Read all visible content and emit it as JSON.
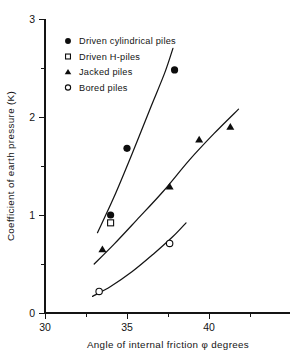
{
  "chart_data": {
    "type": "scatter",
    "title": "",
    "xlabel": "Angle of internal friction φ degrees",
    "ylabel": "Coefficient of earth pressure  (K)",
    "xlim": [
      30,
      43.5
    ],
    "ylim": [
      0,
      3
    ],
    "xticks": [
      30,
      35,
      40
    ],
    "xtick_labels": [
      "30",
      "35",
      "40"
    ],
    "xminor_ticks": [
      32.5,
      37.5,
      42.5
    ],
    "yticks": [
      0,
      1,
      2,
      3
    ],
    "ytick_labels": [
      "0",
      "1",
      "2",
      "3"
    ],
    "yminor_ticks": [
      0.5,
      1.5,
      2.5
    ],
    "grid": false,
    "legend_position": "upper-left-inside",
    "series": [
      {
        "name": "Driven cylindrical piles",
        "marker": "filled-circle",
        "points": [
          {
            "x": 34.0,
            "y": 1.0
          },
          {
            "x": 35.0,
            "y": 1.68
          },
          {
            "x": 37.9,
            "y": 2.48
          }
        ]
      },
      {
        "name": "Driven H-piles",
        "marker": "open-square",
        "points": [
          {
            "x": 34.0,
            "y": 0.92
          }
        ]
      },
      {
        "name": "Jacked piles",
        "marker": "filled-triangle",
        "points": [
          {
            "x": 33.5,
            "y": 0.65
          },
          {
            "x": 37.6,
            "y": 1.29
          },
          {
            "x": 39.4,
            "y": 1.77
          },
          {
            "x": 41.3,
            "y": 1.9
          }
        ]
      },
      {
        "name": "Bored piles",
        "marker": "open-circle",
        "points": [
          {
            "x": 33.3,
            "y": 0.22
          },
          {
            "x": 37.6,
            "y": 0.71
          }
        ]
      }
    ],
    "curves": [
      {
        "name": "driven-piles-trend",
        "for_series": "Driven cylindrical piles",
        "points": [
          {
            "x": 33.2,
            "y": 0.82
          },
          {
            "x": 34.2,
            "y": 1.18
          },
          {
            "x": 35.3,
            "y": 1.62
          },
          {
            "x": 36.4,
            "y": 2.08
          },
          {
            "x": 37.3,
            "y": 2.45
          },
          {
            "x": 37.8,
            "y": 2.7
          }
        ]
      },
      {
        "name": "jacked-piles-trend",
        "for_series": "Jacked piles",
        "points": [
          {
            "x": 33.0,
            "y": 0.5
          },
          {
            "x": 34.2,
            "y": 0.7
          },
          {
            "x": 35.6,
            "y": 0.95
          },
          {
            "x": 37.2,
            "y": 1.24
          },
          {
            "x": 38.8,
            "y": 1.56
          },
          {
            "x": 40.3,
            "y": 1.83
          },
          {
            "x": 41.8,
            "y": 2.08
          }
        ]
      },
      {
        "name": "bored-piles-trend",
        "for_series": "Bored piles",
        "points": [
          {
            "x": 32.9,
            "y": 0.17
          },
          {
            "x": 34.0,
            "y": 0.27
          },
          {
            "x": 35.3,
            "y": 0.42
          },
          {
            "x": 36.6,
            "y": 0.6
          },
          {
            "x": 37.8,
            "y": 0.78
          },
          {
            "x": 38.6,
            "y": 0.92
          }
        ]
      }
    ],
    "legend": [
      {
        "label": "Driven cylindrical piles",
        "marker": "filled-circle"
      },
      {
        "label": "Driven H-piles",
        "marker": "open-square"
      },
      {
        "label": "Jacked piles",
        "marker": "filled-triangle"
      },
      {
        "label": "Bored piles",
        "marker": "open-circle"
      }
    ],
    "colors": {
      "ink": "#141414",
      "background": "#ffffff"
    }
  }
}
